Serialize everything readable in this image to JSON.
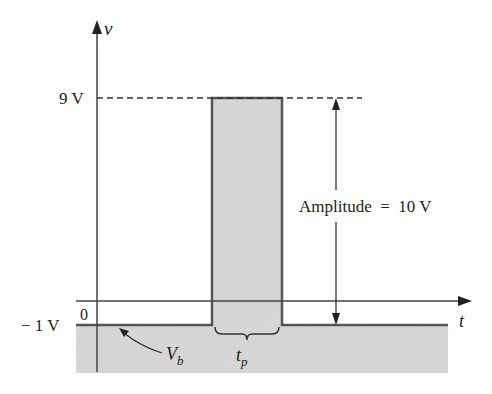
{
  "diagram": {
    "type": "pulse-waveform",
    "axes": {
      "vertical_label": "v",
      "horizontal_label": "t",
      "origin_label": "0"
    },
    "levels": {
      "top_label": "9 V",
      "base_label": "− 1 V"
    },
    "annotations": {
      "amplitude_label": "Amplitude  =  10 V",
      "baseline_label": "V",
      "baseline_sub": "b",
      "pulse_width_label": "t",
      "pulse_width_sub": "p"
    },
    "values": {
      "peak_voltage": 9,
      "base_voltage": -1,
      "amplitude": 10,
      "unit": "V"
    },
    "colors": {
      "fill": "#d6d6d6",
      "line": "#444444",
      "text": "#222222"
    }
  }
}
